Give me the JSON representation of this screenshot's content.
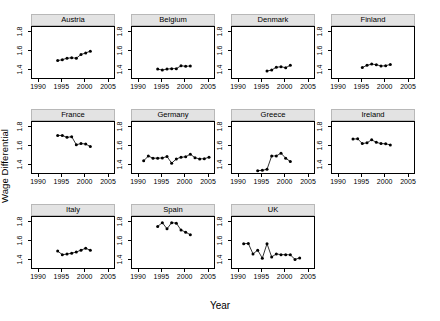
{
  "figure": {
    "ylabel": "Wage Differential",
    "xlabel": "Year"
  },
  "axes": {
    "ylim": [
      1.3,
      1.86
    ],
    "xlim": [
      1988.5,
      2006.5
    ],
    "yticks": [
      1.4,
      1.6,
      1.8
    ],
    "ytick_labels": [
      "1.4",
      "1.6",
      "1.8"
    ],
    "xticks": [
      1990,
      1995,
      2000,
      2005
    ],
    "xtick_labels": [
      "1990",
      "1995",
      "2000",
      "2005"
    ]
  },
  "chart_data": {
    "type": "line",
    "title": "",
    "xlabel": "Year",
    "ylabel": "Wage Differential",
    "ylim": [
      1.3,
      1.86
    ],
    "xlim": [
      1988.5,
      2006.5
    ],
    "grid": false,
    "legend": "none",
    "layout": "trellis 4x3, 11 panels",
    "panels": [
      {
        "label": "Austria",
        "x": [
          1994,
          1995,
          1996,
          1997,
          1998,
          1999,
          2000,
          2001
        ],
        "values": [
          1.505,
          1.515,
          1.53,
          1.535,
          1.53,
          1.57,
          1.585,
          1.605
        ]
      },
      {
        "label": "Belgium",
        "x": [
          1994,
          1995,
          1996,
          1997,
          1998,
          1999,
          2000,
          2001
        ],
        "values": [
          1.415,
          1.405,
          1.415,
          1.42,
          1.42,
          1.45,
          1.445,
          1.448
        ]
      },
      {
        "label": "Denmark",
        "x": [
          1996,
          1997,
          1998,
          1999,
          2000,
          2001
        ],
        "values": [
          1.395,
          1.405,
          1.435,
          1.44,
          1.43,
          1.455
        ]
      },
      {
        "label": "Finland",
        "x": [
          1995,
          1996,
          1997,
          1998,
          1999,
          2000,
          2001
        ],
        "values": [
          1.432,
          1.455,
          1.468,
          1.462,
          1.448,
          1.45,
          1.465
        ]
      },
      {
        "label": "France",
        "x": [
          1994,
          1995,
          1996,
          1997,
          1998,
          1999,
          2000,
          2001
        ],
        "values": [
          1.718,
          1.718,
          1.698,
          1.705,
          1.62,
          1.632,
          1.628,
          1.6
        ]
      },
      {
        "label": "Germany",
        "x": [
          1991,
          1992,
          1993,
          1994,
          1995,
          1996,
          1997,
          1998,
          1999,
          2000,
          2001,
          2002,
          2003,
          2004,
          2005
        ],
        "values": [
          1.45,
          1.5,
          1.478,
          1.478,
          1.48,
          1.495,
          1.425,
          1.47,
          1.488,
          1.492,
          1.52,
          1.482,
          1.47,
          1.472,
          1.488
        ]
      },
      {
        "label": "Greece",
        "x": [
          1994,
          1995,
          1996,
          1997,
          1998,
          1999,
          2000,
          2001
        ],
        "values": [
          1.345,
          1.35,
          1.36,
          1.5,
          1.502,
          1.53,
          1.478,
          1.442
        ]
      },
      {
        "label": "Ireland",
        "x": [
          1993,
          1994,
          1995,
          1996,
          1997,
          1998,
          1999,
          2000,
          2001
        ],
        "values": [
          1.68,
          1.682,
          1.632,
          1.64,
          1.672,
          1.645,
          1.632,
          1.63,
          1.618
        ]
      },
      {
        "label": "Italy",
        "x": [
          1994,
          1995,
          1996,
          1997,
          1998,
          1999,
          2000,
          2001
        ],
        "values": [
          1.5,
          1.462,
          1.468,
          1.478,
          1.49,
          1.51,
          1.53,
          1.508
        ]
      },
      {
        "label": "Spain",
        "x": [
          1994,
          1995,
          1996,
          1997,
          1998,
          1999,
          2000,
          2001
        ],
        "values": [
          1.76,
          1.8,
          1.735,
          1.8,
          1.795,
          1.722,
          1.7,
          1.672
        ]
      },
      {
        "label": "UK",
        "x": [
          1991,
          1992,
          1993,
          1994,
          1995,
          1996,
          1997,
          1998,
          1999,
          2000,
          2001,
          2002,
          2003
        ],
        "values": [
          1.578,
          1.58,
          1.47,
          1.51,
          1.425,
          1.578,
          1.438,
          1.47,
          1.462,
          1.462,
          1.46,
          1.412,
          1.428
        ]
      }
    ]
  }
}
